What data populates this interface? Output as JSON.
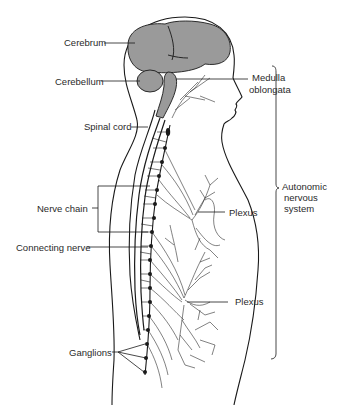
{
  "diagram": {
    "type": "anatomical-illustration",
    "colors": {
      "line": "#1a1a1a",
      "brain_fill": "#9a9a9a",
      "background": "#ffffff",
      "label_text": "#2a2a2a"
    },
    "labels": {
      "cerebrum": "Cerebrum",
      "cerebellum": "Cerebellum",
      "medulla_line1": "Medulla",
      "medulla_line2": "oblongata",
      "spinal_cord": "Spinal cord",
      "nerve_chain": "Nerve chain",
      "connecting_nerve": "Connecting nerve",
      "plexus_upper": "Plexus",
      "plexus_lower": "Plexus",
      "ganglions": "Ganglions",
      "ans_line1": "Autonomic",
      "ans_line2": "nervous",
      "ans_line3": "system"
    }
  }
}
